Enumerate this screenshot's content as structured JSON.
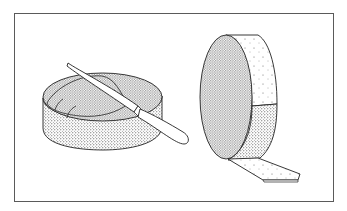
{
  "illustration": {
    "title": "Cheese wheels illustration",
    "description": "Line drawing of two round cheeses: one lying flat with a knife slicing under the top rind, one standing on edge with a strip of rind peeled away from the side.",
    "colors": {
      "frame": "#5a5a5a",
      "ink": "#222222",
      "background": "#ffffff"
    },
    "objects": [
      {
        "name": "flat-cheese-wheel",
        "label": "Cheese wheel with knife"
      },
      {
        "name": "standing-cheese-wheel",
        "label": "Cheese wheel with peeled rind strip"
      }
    ]
  }
}
